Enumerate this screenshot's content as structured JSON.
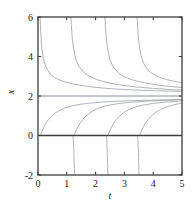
{
  "chart_data": {
    "type": "line",
    "title": "",
    "subtitle": "",
    "xlabel": "t",
    "ylabel": "x",
    "xlim": [
      0,
      5
    ],
    "ylim": [
      -2,
      6
    ],
    "xticks": [
      0,
      1,
      2,
      3,
      4,
      5
    ],
    "xtick_labels": [
      "0",
      "1",
      "2",
      "3",
      "4",
      "5"
    ],
    "yticks": [
      -2,
      0,
      2,
      4,
      6
    ],
    "ytick_labels": [
      "-2",
      "0",
      "2",
      "4",
      "6"
    ],
    "grid": false,
    "legend": null,
    "frame": "box",
    "ticks_all_sides": true,
    "annotations": [],
    "equilibria": [
      {
        "name": "stable-equilibrium",
        "value": 2,
        "style": "solid",
        "emphasis": "medium"
      },
      {
        "name": "unstable-equilibrium",
        "value": 0,
        "style": "solid",
        "emphasis": "heavy"
      }
    ],
    "series": [
      {
        "name": "upper-solution-1",
        "branch": "above",
        "blowup_t": 0.05,
        "x": [
          0.07,
          0.1,
          0.14,
          0.2,
          0.28,
          0.4,
          0.55,
          0.75,
          1.0,
          1.4,
          1.9,
          2.5,
          3.2,
          4.0,
          5.0
        ],
        "y": [
          6.0,
          5.0,
          4.3,
          3.8,
          3.45,
          3.15,
          2.95,
          2.8,
          2.68,
          2.55,
          2.45,
          2.37,
          2.31,
          2.27,
          2.23
        ]
      },
      {
        "name": "upper-solution-2",
        "branch": "above",
        "blowup_t": 1.12,
        "x": [
          1.14,
          1.18,
          1.24,
          1.32,
          1.44,
          1.6,
          1.8,
          2.05,
          2.35,
          2.75,
          3.2,
          3.7,
          4.25,
          4.7,
          5.0
        ],
        "y": [
          6.0,
          5.0,
          4.3,
          3.8,
          3.45,
          3.18,
          2.98,
          2.82,
          2.7,
          2.58,
          2.49,
          2.42,
          2.36,
          2.32,
          2.3
        ]
      },
      {
        "name": "upper-solution-3",
        "branch": "above",
        "blowup_t": 2.3,
        "x": [
          2.32,
          2.36,
          2.42,
          2.5,
          2.62,
          2.78,
          2.98,
          3.22,
          3.52,
          3.88,
          4.25,
          4.6,
          4.85,
          5.0
        ],
        "y": [
          6.0,
          5.0,
          4.3,
          3.8,
          3.45,
          3.18,
          2.98,
          2.84,
          2.72,
          2.62,
          2.54,
          2.48,
          2.45,
          2.43
        ]
      },
      {
        "name": "upper-solution-4",
        "branch": "above",
        "blowup_t": 3.42,
        "x": [
          3.44,
          3.48,
          3.54,
          3.62,
          3.74,
          3.9,
          4.1,
          4.34,
          4.6,
          4.82,
          4.95,
          5.0
        ],
        "y": [
          6.0,
          5.0,
          4.3,
          3.8,
          3.45,
          3.2,
          3.02,
          2.88,
          2.78,
          2.72,
          2.69,
          2.68
        ]
      },
      {
        "name": "middle-solution-1",
        "branch": "between",
        "t0": 0.08,
        "x": [
          0.08,
          0.2,
          0.35,
          0.55,
          0.8,
          1.1,
          1.45,
          1.85,
          2.3,
          2.8,
          3.35,
          3.95,
          4.5,
          5.0
        ],
        "y": [
          0.0,
          0.45,
          0.8,
          1.1,
          1.32,
          1.48,
          1.58,
          1.65,
          1.7,
          1.74,
          1.77,
          1.79,
          1.81,
          1.82
        ]
      },
      {
        "name": "middle-solution-2",
        "branch": "between",
        "t0": 1.25,
        "x": [
          1.25,
          1.38,
          1.54,
          1.74,
          1.98,
          2.28,
          2.62,
          3.02,
          3.45,
          3.92,
          4.4,
          4.75,
          5.0
        ],
        "y": [
          0.0,
          0.45,
          0.8,
          1.1,
          1.32,
          1.48,
          1.58,
          1.66,
          1.71,
          1.75,
          1.78,
          1.8,
          1.81
        ]
      },
      {
        "name": "middle-solution-3",
        "branch": "between",
        "t0": 2.42,
        "x": [
          2.42,
          2.55,
          2.71,
          2.91,
          3.15,
          3.45,
          3.79,
          4.18,
          4.58,
          4.85,
          5.0
        ],
        "y": [
          0.0,
          0.45,
          0.8,
          1.1,
          1.32,
          1.48,
          1.58,
          1.66,
          1.71,
          1.74,
          1.76
        ]
      },
      {
        "name": "middle-solution-4",
        "branch": "between",
        "t0": 3.52,
        "x": [
          3.52,
          3.65,
          3.81,
          4.01,
          4.25,
          4.54,
          4.8,
          4.95,
          5.0
        ],
        "y": [
          0.0,
          0.45,
          0.8,
          1.1,
          1.32,
          1.48,
          1.58,
          1.63,
          1.65
        ]
      },
      {
        "name": "lower-solution-1",
        "branch": "below",
        "t0": 1.22,
        "x": [
          1.22,
          1.24,
          1.25,
          1.26,
          1.27
        ],
        "y": [
          0.0,
          -0.6,
          -1.1,
          -1.6,
          -2.0
        ]
      },
      {
        "name": "lower-solution-2",
        "branch": "below",
        "t0": 2.38,
        "x": [
          2.38,
          2.4,
          2.41,
          2.42,
          2.43
        ],
        "y": [
          0.0,
          -0.6,
          -1.1,
          -1.6,
          -2.0
        ]
      },
      {
        "name": "lower-solution-3",
        "branch": "below",
        "t0": 3.46,
        "x": [
          3.46,
          3.48,
          3.49,
          3.5,
          3.51
        ],
        "y": [
          0.0,
          -0.6,
          -1.1,
          -1.6,
          -2.0
        ]
      }
    ],
    "colors": {
      "curve": "#9aa0a6",
      "equilibrium_stable": "#8a9097",
      "equilibrium_unstable": "#3d3d3d",
      "frame": "#3d3d3d",
      "background": "#ffffff"
    }
  }
}
